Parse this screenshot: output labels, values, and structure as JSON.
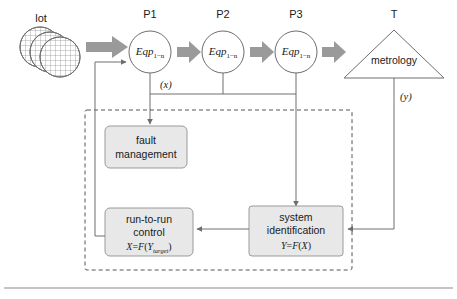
{
  "diagram": {
    "colors": {
      "stroke": "#6e6e6e",
      "box_fill": "#e8e8e8",
      "box_stroke": "#9a9a9a",
      "arrow_fill": "#9a9a9a",
      "dashed": "#555555",
      "text": "#1a1a1a",
      "rule": "#b0b0b0"
    },
    "lot": {
      "label": "lot",
      "icon": "wafer-stack-icon",
      "wafer_count": 3
    },
    "process_steps": [
      {
        "id": "P1",
        "header": "P1",
        "body": "Eqp",
        "subscript": "1−n"
      },
      {
        "id": "P2",
        "header": "P2",
        "body": "Eqp",
        "subscript": "1−n"
      },
      {
        "id": "P3",
        "header": "P3",
        "body": "Eqp",
        "subscript": "1−n"
      }
    ],
    "metrology": {
      "header": "T",
      "label": "metrology",
      "shape": "triangle"
    },
    "signals": {
      "x": "(x)",
      "y": "(y)"
    },
    "blocks": [
      {
        "id": "fault-management",
        "line1": "fault",
        "line2": "management",
        "formula": ""
      },
      {
        "id": "run-to-run-control",
        "line1": "run-to-run",
        "line2": "control",
        "formula_lhs": "X",
        "formula_eq": "=",
        "formula_fn": "F",
        "formula_open": "(",
        "formula_var": "Y",
        "formula_sub": "target",
        "formula_close": ")"
      },
      {
        "id": "system-identification",
        "line1": "system",
        "line2": "identification",
        "formula_lhs": "Y",
        "formula_eq": "=",
        "formula_fn": "F",
        "formula_open": "(",
        "formula_var": "X",
        "formula_sub": "",
        "formula_close": ")"
      }
    ],
    "boundary": {
      "style": "dashed",
      "name": "control-system-boundary"
    }
  }
}
